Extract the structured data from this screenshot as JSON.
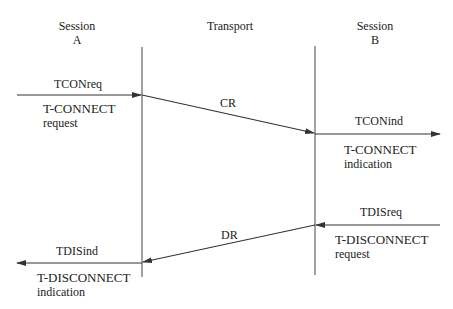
{
  "headers": {
    "session_a": [
      "Session",
      "A"
    ],
    "transport": "Transport",
    "session_b": [
      "Session",
      "B"
    ]
  },
  "primitives": {
    "tconreq": {
      "name": "TCONreq",
      "desc": [
        "T-CONNECT",
        "request"
      ]
    },
    "tconind": {
      "name": "TCONind",
      "desc": [
        "T-CONNECT",
        "indication"
      ]
    },
    "tdisreq": {
      "name": "TDISreq",
      "desc": [
        "T-DISCONNECT",
        "request"
      ]
    },
    "tdisind": {
      "name": "TDISind",
      "desc": [
        "T-DISCONNECT",
        "indication"
      ]
    }
  },
  "tpdus": {
    "cr": "CR",
    "dr": "DR"
  },
  "colors": {
    "line": "#333333",
    "text": "#222222"
  }
}
